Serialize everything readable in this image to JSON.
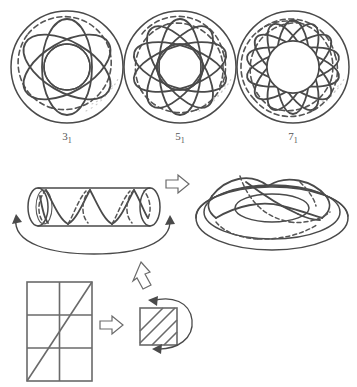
{
  "figure": {
    "background_color": "#ffffff",
    "stroke_color": "#4a4a4a",
    "dashed_stroke_color": "#555555"
  },
  "torus_knots": {
    "caption_note": "Torus knots drawn on a flattened torus, viewed from above",
    "items": [
      {
        "label_main": "3",
        "label_sub": "1",
        "label_text": "3₁",
        "name": "trefoil-knot",
        "crossings": 3,
        "petals": 3,
        "center_x": 67,
        "center_y": 67,
        "outer_radius": 56,
        "inner_radius": 23
      },
      {
        "label_main": "5",
        "label_sub": "1",
        "label_text": "5₁",
        "name": "cinquefoil-knot",
        "crossings": 5,
        "petals": 5,
        "center_x": 180,
        "center_y": 67,
        "outer_radius": 56,
        "inner_radius": 23
      },
      {
        "label_main": "7",
        "label_sub": "1",
        "label_text": "7₁",
        "name": "septafoil-knot",
        "crossings": 7,
        "petals": 7,
        "center_x": 293,
        "center_y": 67,
        "outer_radius": 56,
        "inner_radius": 23
      }
    ]
  },
  "construction": {
    "cylinder": {
      "name": "cylinder-with-helix",
      "helix_turns": 4,
      "wrap_arrow_label": "bend and glue ends",
      "arrowheads": 2
    },
    "cylinder_to_torus_arrow": {
      "name": "arrow-right-cylinder-to-torus",
      "direction": "right",
      "style": "hollow-outline"
    },
    "torus": {
      "name": "torus-with-knot",
      "description": "Torus in perspective with knot curves on its surface"
    },
    "square_to_cylinder_arrow": {
      "name": "arrow-up-square-to-cylinder",
      "direction": "up-left",
      "style": "hollow-outline"
    },
    "grid": {
      "name": "fundamental-domain-grid",
      "columns": 2,
      "rows": 3,
      "diagonal": "bottom-left to top-right",
      "description": "Rectangle subdivided into a 2 by 3 grid with a diagonal line of slope 3/2"
    },
    "grid_to_square_arrow": {
      "name": "arrow-right-grid-to-square",
      "direction": "right",
      "style": "hollow-outline"
    },
    "hatched_square": {
      "name": "hatched-square",
      "hatch_lines": 3,
      "hatch_direction": "bottom-left to top-right",
      "rotation_arrows": 2,
      "rotation_label": "identify opposite edges"
    }
  }
}
